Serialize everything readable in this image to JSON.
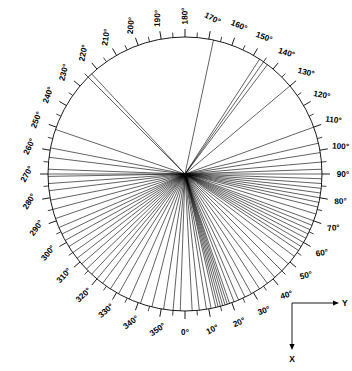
{
  "chart_data": {
    "type": "scatter",
    "title": "",
    "subtitle": "",
    "xlabel": "X",
    "ylabel": "Y",
    "plot_style": "polar-rose-diagram",
    "grid": false,
    "legend": null,
    "angular_axis": {
      "units": "degrees",
      "range": [
        0,
        360
      ],
      "label_interval": 10,
      "tick_interval": 5,
      "zero_direction": "down",
      "rotation_sense": "counterclockwise-from-down",
      "tick_labels": [
        "0°",
        "10°",
        "20°",
        "30°",
        "40°",
        "50°",
        "60°",
        "70°",
        "80°",
        "90°",
        "100°",
        "110°",
        "120°",
        "130°",
        "140°",
        "150°",
        "160°",
        "170°",
        "180°",
        "190°",
        "200°",
        "210°",
        "220°",
        "230°",
        "240°",
        "250°",
        "260°",
        "270°",
        "280°",
        "290°",
        "300°",
        "310°",
        "320°",
        "330°",
        "340°",
        "350°"
      ],
      "tick_values": [
        0,
        10,
        20,
        30,
        40,
        50,
        60,
        70,
        80,
        90,
        100,
        110,
        120,
        130,
        140,
        150,
        160,
        170,
        180,
        190,
        200,
        210,
        220,
        230,
        240,
        250,
        260,
        270,
        280,
        290,
        300,
        310,
        320,
        330,
        340,
        350
      ]
    },
    "radial_axis": {
      "labeled": false,
      "all_radii_equal": true,
      "normalized_radius": 1.0
    },
    "series": [
      {
        "name": "radial traces",
        "unit": "degrees",
        "values": [
          3,
          6,
          9,
          11,
          13,
          14,
          15,
          16,
          17,
          18,
          19,
          21,
          23,
          26,
          29,
          33,
          37,
          41,
          45,
          49,
          53,
          56,
          58,
          60,
          62,
          64,
          66,
          68,
          70,
          73,
          76,
          78,
          80,
          82,
          84,
          86,
          88,
          90,
          92,
          95,
          99,
          103,
          110,
          130,
          143,
          145,
          147,
          168,
          223,
          225,
          251,
          259,
          263,
          268,
          270,
          271,
          274,
          277,
          281,
          285,
          289,
          293,
          296,
          299,
          302,
          305,
          308,
          311,
          314,
          317,
          320,
          323,
          327,
          331,
          336,
          341,
          346,
          351,
          355,
          358
        ]
      }
    ],
    "annotations": [
      {
        "text": "Y",
        "position": "axis-indicator-right",
        "arrow": "right"
      },
      {
        "text": "X",
        "position": "axis-indicator-down",
        "arrow": "down"
      }
    ]
  },
  "geometry": {
    "center_x": 185,
    "center_y": 174,
    "radius": 137,
    "tick_major_len": 8,
    "tick_minor_len": 5,
    "label_offset": 13
  },
  "axis_indicator": {
    "y_label": "Y",
    "x_label": "X",
    "origin_x": 292,
    "origin_y": 303,
    "arm_length": 42
  },
  "colors": {
    "ink": "#000000",
    "background": "#ffffff"
  }
}
